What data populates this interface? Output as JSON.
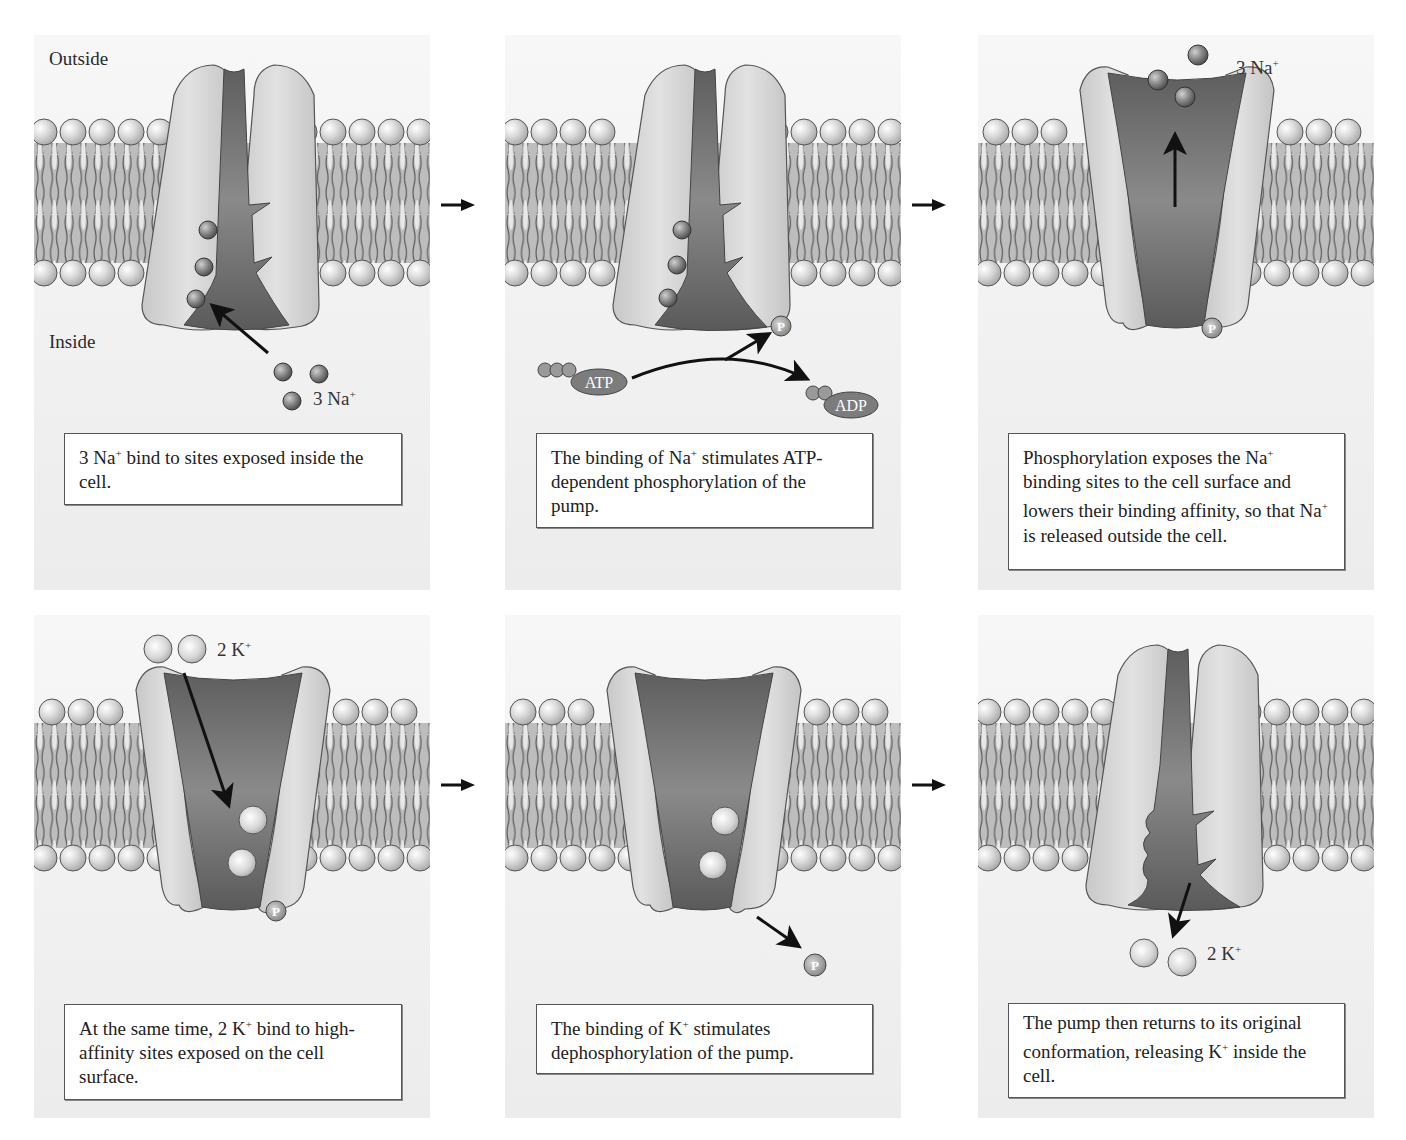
{
  "figure": {
    "region_labels": {
      "outside": "Outside",
      "inside": "Inside"
    },
    "colors": {
      "panel_bg": "#efefef",
      "protein_light": "#d4d4d4",
      "protein_channel": "#7a7a7a",
      "lipid_head": "#d8d8d8",
      "lipid_tail_band": "#b8b8b8",
      "na_ion": "#8a8a8a",
      "k_ion": "#dadada",
      "arrow": "#111111"
    },
    "panels": [
      {
        "id": 1,
        "ion_label": {
          "count": "3",
          "ion": "Na",
          "charge": "+"
        },
        "caption": {
          "pre": "3 Na",
          "sup": "+",
          "post": " bind to sites exposed inside the cell."
        }
      },
      {
        "id": 2,
        "molecule_labels": {
          "atp": "ATP",
          "adp": "ADP",
          "phosphate": "P"
        },
        "caption": {
          "pre": "The binding of Na",
          "sup": "+",
          "post": " stimulates ATP-dependent phosphorylation of the pump."
        }
      },
      {
        "id": 3,
        "ion_label": {
          "count": "3",
          "ion": "Na",
          "charge": "+"
        },
        "phosphate": "P",
        "caption": {
          "pre": "Phosphorylation exposes the Na",
          "sup": "+",
          "mid": " binding sites to the cell surface and lowers their binding affinity, so that Na",
          "sup2": "+",
          "post": " is released outside the cell."
        }
      },
      {
        "id": 4,
        "ion_label": {
          "count": "2",
          "ion": "K",
          "charge": "+"
        },
        "phosphate": "P",
        "caption": {
          "pre": "At the same time, 2 K",
          "sup": "+",
          "post": " bind to high-affinity sites exposed on the cell surface."
        }
      },
      {
        "id": 5,
        "phosphate": "P",
        "caption": {
          "pre": "The binding of K",
          "sup": "+",
          "post": " stimulates dephosphorylation of the pump."
        }
      },
      {
        "id": 6,
        "ion_label": {
          "count": "2",
          "ion": "K",
          "charge": "+"
        },
        "caption": {
          "pre": "The pump then returns to its original conformation, releasing K",
          "sup": "+",
          "post": " inside the cell."
        }
      }
    ]
  }
}
